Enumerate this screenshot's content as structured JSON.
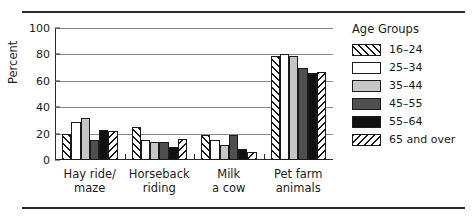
{
  "chart_data": {
    "type": "bar",
    "title": "",
    "xlabel": "",
    "ylabel": "Percent",
    "ylim": [
      0,
      100
    ],
    "yticks": [
      0,
      20,
      40,
      60,
      80,
      100
    ],
    "grid": true,
    "legend_position": "right",
    "legend_title": "Age Groups",
    "categories": [
      "Hay ride/ maze",
      "Horseback riding",
      "Milk a cow",
      "Pet farm animals"
    ],
    "category_lines": [
      [
        "Hay ride/",
        "maze"
      ],
      [
        "Horseback",
        "riding"
      ],
      [
        "Milk",
        "a cow"
      ],
      [
        "Pet farm",
        "animals"
      ]
    ],
    "series": [
      {
        "name": "16–24",
        "pattern": "forward-hatch",
        "values": [
          20,
          25,
          19,
          79
        ]
      },
      {
        "name": "25–34",
        "pattern": "white",
        "values": [
          29,
          15,
          15,
          80
        ]
      },
      {
        "name": "35–44",
        "pattern": "light-gray",
        "values": [
          32,
          14,
          11,
          79
        ]
      },
      {
        "name": "45–55",
        "pattern": "dark-gray",
        "values": [
          15,
          14,
          19,
          70
        ]
      },
      {
        "name": "55–64",
        "pattern": "black",
        "values": [
          23,
          10,
          8,
          66
        ]
      },
      {
        "name": "65 and over",
        "pattern": "backward-hatch",
        "values": [
          22,
          16,
          6,
          67
        ]
      }
    ]
  },
  "colors": {
    "axis": "#2b2b2b",
    "gridline": "#8a8a8a",
    "light_gray": "#c6c6c6",
    "dark_gray": "#4f4f4f",
    "black": "#111111",
    "white": "#ffffff"
  }
}
